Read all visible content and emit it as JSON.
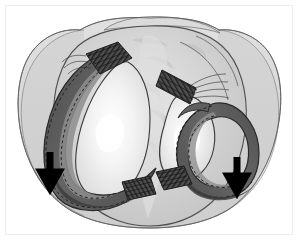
{
  "figure": {
    "title": "Tibial plateau superior view with medial and lateral menisci",
    "view": "superior (axial) view of right tibial plateau",
    "background_color": "#ffffff",
    "frame": {
      "border_color": "#ededed",
      "border_width_px": 1,
      "x": 5,
      "y": 5,
      "width": 288,
      "height": 230
    }
  },
  "palette": {
    "outline_dark": "#2b2b2b",
    "outline_mid": "#555555",
    "outline_light": "#7d7d7d",
    "capsule_fill": "#c9c9c9",
    "capsule_fill_light": "#d6d6d6",
    "plateau_fill": "#cfcfcf",
    "plateau_highlight": "#e4e4e4",
    "cartilage_light": "#f2f2f2",
    "cartilage_white": "#fcfcfc",
    "meniscus_dark": "#5a5a5a",
    "meniscus_mid": "#707070",
    "meniscus_inner": "#8e8e8e",
    "meniscus_shadow": "#3f3f3f",
    "ligament_band": "#4a4a4a",
    "ligament_stripe": "#262626",
    "arrow_color": "#000000",
    "dashed_line": "#1f1f1f"
  },
  "structures": [
    {
      "id": "joint-capsule",
      "label": "Joint capsule / surrounding soft tissue envelope",
      "fill": "#c9c9c9",
      "opacity": 0.75
    },
    {
      "id": "tibial-plateau",
      "label": "Tibial plateau articular surface",
      "fill": "#cfcfcf"
    },
    {
      "id": "medial-plateau-cartilage",
      "label": "Medial tibial condyle articular cartilage",
      "fill": "#f5f5f5"
    },
    {
      "id": "lateral-plateau-cartilage",
      "label": "Lateral tibial condyle articular cartilage",
      "fill": "#f2f2f2"
    },
    {
      "id": "medial-meniscus",
      "label": "Medial meniscus (left C-shaped ring)",
      "fill": "#5a5a5a",
      "shape": "C-shaped crescent, open medially"
    },
    {
      "id": "lateral-meniscus",
      "label": "Lateral meniscus (right C-shaped ring)",
      "fill": "#5a5a5a",
      "shape": "tighter C-shaped crescent, open laterally"
    },
    {
      "id": "anterior-root-attachment-medial",
      "label": "Anterior meniscal root attachment, striped fiber band (upper left)",
      "fill": "#4a4a4a"
    },
    {
      "id": "posterior-root-attachment-medial",
      "label": "Posterior meniscal root attachment, striped fiber band (lower center-left)",
      "fill": "#4a4a4a"
    },
    {
      "id": "anterior-root-attachment-lateral",
      "label": "Anterior meniscal root attachment, striped fiber band (upper right)",
      "fill": "#4a4a4a"
    },
    {
      "id": "posterior-root-attachment-lateral",
      "label": "Posterior meniscal root attachment, striped fiber band (lower center-right)",
      "fill": "#4a4a4a"
    },
    {
      "id": "intercondylar-eminence",
      "label": "Intercondylar eminence / tibial spine region",
      "fill": "#dcdcdc"
    }
  ],
  "annotations": {
    "arrows": [
      {
        "id": "arrow-left",
        "name": "medial-displacement-arrow",
        "direction": "down",
        "color": "#000000",
        "x": 50,
        "y": 155,
        "length_px": 34,
        "meaning": "direction of meniscal displacement / extrusion"
      },
      {
        "id": "arrow-right",
        "name": "lateral-displacement-arrow",
        "direction": "down",
        "color": "#000000",
        "x": 237,
        "y": 160,
        "length_px": 32,
        "meaning": "direction of meniscal displacement / extrusion"
      }
    ],
    "text_labels": []
  }
}
